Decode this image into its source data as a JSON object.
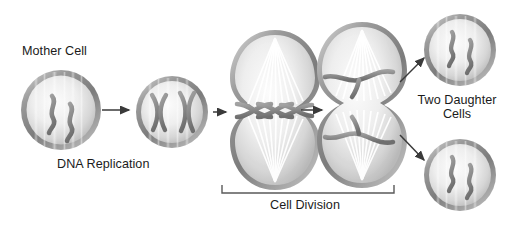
{
  "figure": {
    "background_color": "#ffffff",
    "text_color": "#1b1b1b",
    "membrane_color": "#8e8e8e",
    "chromosome_color": "#8a8a8a",
    "arrow_color": "#3a3a3a",
    "bracket_color": "#5a5a5a",
    "spindle_color": "#ffffff"
  },
  "labels": {
    "mother_cell": "Mother Cell",
    "dna_replication": "DNA Replication",
    "cell_division": "Cell Division",
    "two_daughter_line1": "Two Daughter",
    "two_daughter_line2": "Cells"
  },
  "stages": [
    {
      "id": "mother-cell",
      "label": "Mother Cell",
      "shape": "circle",
      "chromosomes": 2,
      "chromosome_form": "wavy-single",
      "spindle": false
    },
    {
      "id": "replicated-cell",
      "label": "DNA Replication",
      "shape": "circle",
      "chromosomes": 2,
      "chromosome_form": "x-shaped-duplicated",
      "spindle": false
    },
    {
      "id": "metaphase-anaphase-cell",
      "label": "Cell Division",
      "shape": "peanut-early",
      "chromosomes": 4,
      "chromosome_form": "aligned-at-equator",
      "spindle": true
    },
    {
      "id": "telophase-cell",
      "label": "Cell Division",
      "shape": "peanut-late",
      "chromosomes": 4,
      "chromosome_form": "separated-to-poles",
      "spindle": true
    },
    {
      "id": "daughter-cell-top",
      "label": "Two Daughter Cells",
      "shape": "circle",
      "chromosomes": 2,
      "chromosome_form": "wavy-single",
      "spindle": false
    },
    {
      "id": "daughter-cell-bottom",
      "label": "Two Daughter Cells",
      "shape": "circle",
      "chromosomes": 2,
      "chromosome_form": "wavy-single",
      "spindle": false
    }
  ],
  "arrows": [
    {
      "id": "arrow-1",
      "from": "mother-cell",
      "to": "replicated-cell",
      "direction": "right"
    },
    {
      "id": "arrow-2",
      "from": "replicated-cell",
      "to": "metaphase-anaphase-cell",
      "direction": "right"
    },
    {
      "id": "arrow-3",
      "from": "metaphase-anaphase-cell",
      "to": "telophase-cell",
      "direction": "right"
    },
    {
      "id": "arrow-4",
      "from": "telophase-cell",
      "to": "daughter-cell-top",
      "direction": "up-right"
    },
    {
      "id": "arrow-5",
      "from": "telophase-cell",
      "to": "daughter-cell-bottom",
      "direction": "down-right"
    }
  ],
  "bracket": {
    "id": "cell-division-bracket",
    "label": "Cell Division",
    "spans": [
      "metaphase-anaphase-cell",
      "telophase-cell"
    ]
  }
}
